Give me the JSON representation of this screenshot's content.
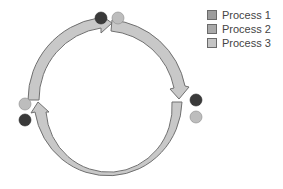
{
  "legend": {
    "items": [
      {
        "label": "Process 1",
        "color": "#9c9c9c"
      },
      {
        "label": "Process 2",
        "color": "#a9a9a9"
      },
      {
        "label": "Process 3",
        "color": "#c4c4c4"
      }
    ]
  },
  "diagram": {
    "type": "cycle",
    "arrow_fill": "#c8c8c8",
    "arrow_stroke": "#707070",
    "dot_dark": "#3a3a3a",
    "dot_light": "#bdbdbd",
    "arrows": [
      {
        "name": "arrow-left-to-top",
        "from": "left",
        "to": "top"
      },
      {
        "name": "arrow-top-to-right",
        "from": "top",
        "to": "right"
      },
      {
        "name": "arrow-right-to-left-bottom",
        "from": "right",
        "to": "left"
      }
    ],
    "dot_pairs": [
      {
        "position": "top",
        "dots": [
          "dark",
          "light"
        ]
      },
      {
        "position": "right",
        "dots": [
          "dark",
          "light"
        ]
      },
      {
        "position": "left",
        "dots": [
          "light",
          "dark"
        ]
      }
    ]
  }
}
